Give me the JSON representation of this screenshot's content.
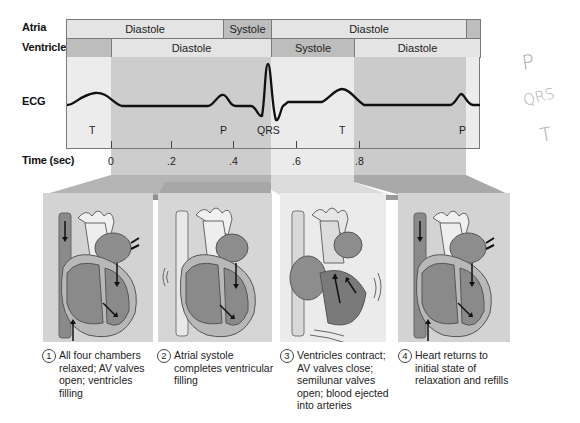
{
  "rows": {
    "atria": {
      "label": "Atria",
      "segments": [
        {
          "label": "Diastole",
          "phase": "diastole",
          "x0": 66,
          "x1": 223
        },
        {
          "label": "Systole",
          "phase": "systole",
          "x0": 223,
          "x1": 271
        },
        {
          "label": "Diastole",
          "phase": "diastole",
          "x0": 271,
          "x1": 466
        },
        {
          "label": "",
          "phase": "systole",
          "x0": 466,
          "x1": 480
        }
      ]
    },
    "ventricles": {
      "label": "Ventricles",
      "segments": [
        {
          "label": "",
          "phase": "systole",
          "x0": 66,
          "x1": 111
        },
        {
          "label": "Diastole",
          "phase": "diastole",
          "x0": 111,
          "x1": 271
        },
        {
          "label": "Systole",
          "phase": "systole",
          "x0": 271,
          "x1": 354
        },
        {
          "label": "Diastole",
          "phase": "diastole",
          "x0": 354,
          "x1": 480
        }
      ]
    }
  },
  "ecg": {
    "label": "ECG",
    "wave_labels": [
      {
        "text": "T",
        "x": 92
      },
      {
        "text": "P",
        "x": 228
      },
      {
        "text": "QRS",
        "x": 258
      },
      {
        "text": "T",
        "x": 339
      },
      {
        "text": "P",
        "x": 462
      }
    ]
  },
  "time_axis": {
    "label": "Time (sec)",
    "ticks": [
      {
        "text": "0",
        "x": 111
      },
      {
        "text": ".2",
        "x": 171
      },
      {
        "text": ".4",
        "x": 233
      },
      {
        "text": ".6",
        "x": 296
      },
      {
        "text": ".8",
        "x": 359
      }
    ]
  },
  "stages": [
    {
      "number": "1",
      "text": "All four chambers relaxed; AV valves open; ventricles filling",
      "lines": [
        "All four chambers",
        "relaxed; AV valves",
        "open; ventricles",
        "filling"
      ]
    },
    {
      "number": "2",
      "text": "Atrial systole completes ventricular filling",
      "lines": [
        "Atrial systole",
        "completes ventricular",
        "filling"
      ]
    },
    {
      "number": "3",
      "text": "Ventricles contract; AV valves close; semilunar valves open; blood ejected into arteries",
      "lines": [
        "Ventricles contract;",
        "AV valves close;",
        "semilunar valves",
        "open; blood ejected",
        "into arteries"
      ]
    },
    {
      "number": "4",
      "text": "Heart returns to initial state of relaxation and refills",
      "lines": [
        "Heart returns to",
        "initial state of",
        "relaxation and refills"
      ]
    }
  ],
  "handwritten_notes": [
    "P",
    "QRS",
    "T"
  ],
  "colors": {
    "diastole_fill": "#e4e4e4",
    "systole_fill": "#bdbdbd",
    "shade_dark": "#cbcbcb",
    "shade_light": "#ececec",
    "ecg_line": "#111111"
  }
}
